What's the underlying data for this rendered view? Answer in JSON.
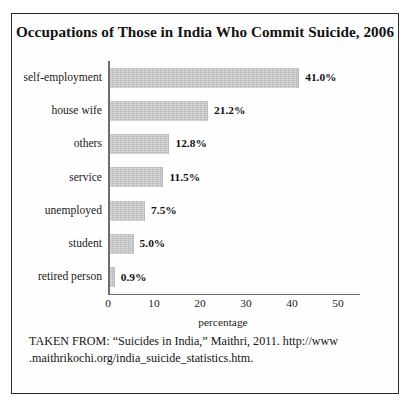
{
  "figure": {
    "title": "Occupations of Those in India Who Commit Suicide, 2006",
    "source_note": "TAKEN FROM: “Suicides in India,” Maithri, 2011. http://www .maithrikochi.org/india_suicide_statistics.htm."
  },
  "chart_data": {
    "type": "bar",
    "orientation": "horizontal",
    "title": "Occupations of Those in India Who Commit Suicide, 2006",
    "categories": [
      "self-employment",
      "house wife",
      "others",
      "service",
      "unemployed",
      "student",
      "retired person"
    ],
    "values": [
      41.0,
      21.2,
      12.8,
      11.5,
      7.5,
      5.0,
      0.9
    ],
    "data_labels": [
      "41.0%",
      "21.2%",
      "12.8%",
      "11.5%",
      "7.5%",
      "5.0%",
      "0.9%"
    ],
    "xlabel": "percentage",
    "ylabel": "",
    "xlim": [
      0,
      50
    ],
    "xticks": [
      0,
      10,
      20,
      30,
      40,
      50
    ],
    "xtick_labels": [
      "0",
      "10",
      "20",
      "30",
      "40",
      "50"
    ],
    "grid": false,
    "legend": null,
    "bar_color": "#c9c9c9",
    "axis_color": "#6d6d6d",
    "text_color": "#1a1a1a"
  }
}
